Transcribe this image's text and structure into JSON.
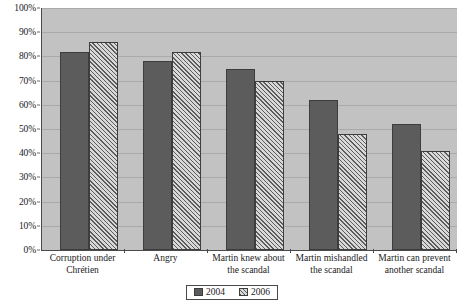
{
  "chart_data": {
    "type": "bar",
    "title": "",
    "subtitle": "",
    "xlabel": "",
    "ylabel": "",
    "ylim": [
      0,
      100
    ],
    "y_ticks": [
      "0%",
      "10%",
      "20%",
      "30%",
      "40%",
      "50%",
      "60%",
      "70%",
      "80%",
      "90%",
      "100%"
    ],
    "y_tick_values": [
      0,
      10,
      20,
      30,
      40,
      50,
      60,
      70,
      80,
      90,
      100
    ],
    "grid": "horizontal",
    "legend_position": "bottom-center",
    "categories": [
      "Corruption under Chrétien",
      "Angry",
      "Martin knew about the scandal",
      "Martin mishandled the scandal",
      "Martin can prevent another scandal"
    ],
    "category_lines": [
      [
        "Corruption under",
        "Chrétien"
      ],
      [
        "Angry"
      ],
      [
        "Martin knew about",
        "the scandal"
      ],
      [
        "Martin mishandled",
        "the scandal"
      ],
      [
        "Martin can prevent",
        "another scandal"
      ]
    ],
    "series": [
      {
        "name": "2004",
        "values": [
          82,
          78,
          75,
          62,
          52
        ],
        "color": "#5c5c5c",
        "fill": "solid"
      },
      {
        "name": "2006",
        "values": [
          86,
          82,
          70,
          48,
          41
        ],
        "color": "#d2d2d2",
        "fill": "diagonal-hatch"
      }
    ],
    "annotations": []
  },
  "colors": {
    "plot_background": "#c2c2c2",
    "gridline": "#aaaaaa",
    "axis": "#4a4a4a",
    "series_2004": "#5c5c5c",
    "series_2006": "#d2d2d2",
    "bar_border": "#3d3d3d",
    "text": "#1a1a1a",
    "page_background": "#ffffff"
  },
  "legend": {
    "items": [
      {
        "label": "2004"
      },
      {
        "label": "2006"
      }
    ]
  }
}
